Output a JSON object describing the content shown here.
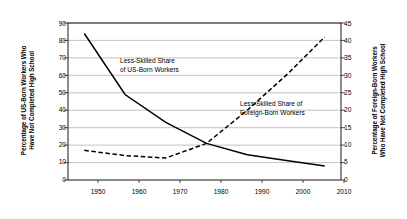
{
  "chart_data": {
    "type": "line",
    "title": "",
    "subtitle": "",
    "xlabel": "",
    "ylabel": "Percentage of US-Born Workers Who Have Not Completed High School",
    "ylabel_right": "Percentage of Foreign-Born Workers Who Have Not Completed High School",
    "xlim": [
      1945,
      2012
    ],
    "ylim": [
      0,
      90
    ],
    "ylim_right": [
      0,
      45
    ],
    "xticks": [
      1950,
      1960,
      1970,
      1980,
      1990,
      2000,
      2010
    ],
    "yticks_left": [
      0,
      10,
      20,
      30,
      40,
      50,
      60,
      70,
      80,
      90
    ],
    "yticks_right": [
      0,
      5,
      10,
      15,
      20,
      25,
      30,
      35,
      40,
      45
    ],
    "grid": "horizontal",
    "legend": "none",
    "series": [
      {
        "name": "Less-Skilled Share of US-Born Workers",
        "axis": "left",
        "style": "solid",
        "color": "#000000",
        "x": [
          1949,
          1959,
          1969,
          1979,
          1989,
          1999,
          2008
        ],
        "values": [
          84,
          49,
          33,
          21,
          14.5,
          11,
          8
        ]
      },
      {
        "name": "Less-Skilled Share of Foreign-Born Workers",
        "axis": "right",
        "style": "dashed",
        "color": "#000000",
        "x": [
          1949,
          1959,
          1969,
          1979,
          1989,
          1999,
          2008
        ],
        "values": [
          8.5,
          7.0,
          6.3,
          10.5,
          20.0,
          30.5,
          41.0
        ]
      }
    ],
    "annotations": [
      {
        "name": "annotation-us-born",
        "line1": "Less-Skilled Share",
        "line2": "of US-Born Workers"
      },
      {
        "name": "annotation-foreign-born",
        "line1": "Less-Skilled Share of",
        "line2": "Foreign-Born Workers"
      }
    ]
  },
  "axes": {
    "left_title": "Percentage of US-Born Workers Who Have Not Completed High School",
    "left_title_line1": "Percentage of US-Born Workers Who",
    "left_title_line2": "Have Not Completed High School",
    "right_title_line1": "Percentage of Foreign-Born Workers",
    "right_title_line2": "Who Have Not Completed High School",
    "y_left": [
      "90",
      "80",
      "70",
      "60",
      "50",
      "40",
      "30",
      "20",
      "10",
      "0"
    ],
    "y_right": [
      "45",
      "40",
      "35",
      "30",
      "25",
      "20",
      "15",
      "10",
      "5",
      "0"
    ],
    "x": [
      "1950",
      "1960",
      "1970",
      "1980",
      "1990",
      "2000",
      "2010"
    ]
  },
  "colors": {
    "background": "#ffffff",
    "axis": "#000000",
    "grid": "#999999",
    "series": "#000000"
  }
}
